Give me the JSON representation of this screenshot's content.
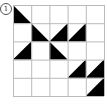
{
  "label": "1",
  "grid": {
    "rows": 5,
    "cols": 5,
    "cell_size": 18.2,
    "line_color": "#bbbbbb",
    "fill_color": "#000000",
    "triangles": [
      {
        "row": 0,
        "col": 0,
        "corner": "bottom-left"
      },
      {
        "row": 1,
        "col": 1,
        "corner": "bottom-left"
      },
      {
        "row": 1,
        "col": 2,
        "corner": "bottom-right"
      },
      {
        "row": 1,
        "col": 3,
        "corner": "bottom-right"
      },
      {
        "row": 2,
        "col": 0,
        "corner": "bottom-right"
      },
      {
        "row": 2,
        "col": 2,
        "corner": "bottom-left"
      },
      {
        "row": 3,
        "col": 3,
        "corner": "bottom-right"
      },
      {
        "row": 3,
        "col": 4,
        "corner": "bottom-right"
      },
      {
        "row": 4,
        "col": 4,
        "corner": "bottom-right"
      }
    ]
  }
}
